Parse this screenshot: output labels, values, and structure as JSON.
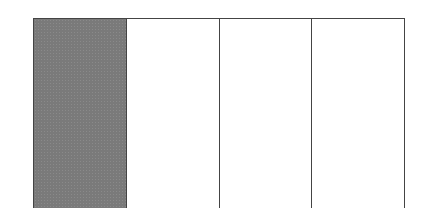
{
  "diagram": {
    "type": "fraction-bar",
    "total_parts": 4,
    "shaded_parts": 1,
    "parts": [
      {
        "index": 0,
        "shaded": true
      },
      {
        "index": 1,
        "shaded": false
      },
      {
        "index": 2,
        "shaded": false
      },
      {
        "index": 3,
        "shaded": false
      }
    ],
    "colors": {
      "shaded": "#7a7a7a",
      "unshaded": "#ffffff",
      "border": "#444444"
    }
  }
}
